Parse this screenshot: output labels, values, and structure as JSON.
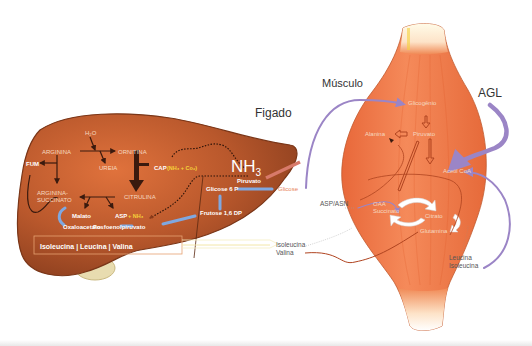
{
  "organs": {
    "liver": {
      "label": "Figado"
    },
    "muscle": {
      "label": "Músculo"
    },
    "fatty_acids": {
      "label": "AGL"
    }
  },
  "liver_labels": {
    "h2o": "H₂O",
    "arginina": "ARGININA",
    "ornitina": "ORNITINA",
    "ureia": "UREIA",
    "fum": "FUM",
    "citrulina": "CITRULINA",
    "arginina_succinato_1": "ARGININA-",
    "arginina_succinato_2": "SUCCINATO",
    "cap": "CAP",
    "cap_detail": "(NH₃ + Co₂)",
    "malato": "Malato",
    "asp": "ASP",
    "asp_nh3": "+ NH₃",
    "oxaloacetato": "Oxaloacetato",
    "fosfoenolpiruvato": "Fosfoenolpiruvato",
    "nh3": "NH",
    "nh3_sub": "3",
    "piruvato": "Piruvato",
    "glicose6p": "Glicose 6 P",
    "frutose16dp": "Frutose 1,6 DP",
    "bcaa_box": "Isoleucina | Leucina | Valina"
  },
  "between_labels": {
    "glicose": "Glicose",
    "asp_asn": "ASP/ASN",
    "isoleucina_valina_1": "Isoleucina",
    "isoleucina_valina_2": "Valina",
    "leucina_isoleucina_1": "Leucina",
    "leucina_isoleucina_2": "Isoleucina"
  },
  "muscle_labels": {
    "glicogenio": "Glicogênio",
    "alanina": "Alanina",
    "piruvato": "Piruvato",
    "acetil_coa": "Acetil CoA",
    "oaa": "OAA",
    "succinato": "Succinato",
    "citrato": "Citrato",
    "glutamina": "Glutamina"
  },
  "colors": {
    "liver": "#b0542c",
    "liver_light": "#d97a45",
    "muscle": "#f07a4a",
    "arrow_purple": "#9b85c6",
    "arrow_blue": "#7fa8e0",
    "arrow_dark": "#3a1a0e",
    "text_light": "#f6d9c0",
    "text_yellow": "#f5d23a",
    "glicose_text": "#e8845a"
  }
}
